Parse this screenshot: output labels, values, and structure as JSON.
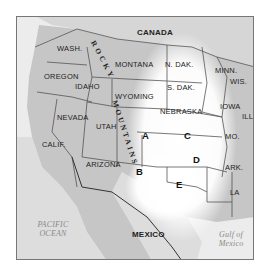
{
  "map": {
    "title_region": "Great Plains and western United States",
    "countries": {
      "canada": "CANADA",
      "mexico": "MEXICO"
    },
    "states": {
      "wash": "WASH.",
      "oregon": "OREGON",
      "idaho": "IDAHO",
      "montana": "MONTANA",
      "wyoming": "WYOMING",
      "nevada": "NEVADA",
      "utah": "UTAH",
      "calif": "CALIF.",
      "arizona": "ARIZONA",
      "n_dak": "N. DAK.",
      "s_dak": "S. DAK.",
      "nebraska": "NEBRASKA",
      "minn": "MINN.",
      "wis": "WIS.",
      "iowa": "IOWA",
      "ill": "ILL.",
      "mo": "MO.",
      "ark": "ARK.",
      "la": "LA"
    },
    "mountains": {
      "word1": "ROCKY",
      "word2": "MOUNTAINS"
    },
    "water": {
      "pacific_line1": "PACIFIC",
      "pacific_line2": "OCEAN",
      "gulf_line1": "Gulf of",
      "gulf_line2": "Mexico"
    },
    "regions": {
      "a": "A",
      "b": "B",
      "c": "C",
      "d": "D",
      "e": "E"
    },
    "colors": {
      "land": "#c9c9c9",
      "plains_highlight": "#ffffff",
      "ocean": "#eeeeee",
      "border": "#555555"
    }
  }
}
